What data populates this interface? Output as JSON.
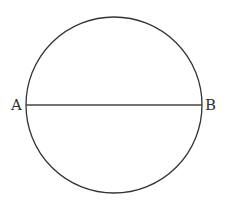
{
  "diagram": {
    "type": "circle-with-diameter",
    "circle": {
      "cx": 114,
      "cy": 105,
      "r": 88,
      "stroke": "#333333"
    },
    "diameter": {
      "from": "A",
      "to": "B",
      "stroke": "#444444"
    },
    "labels": {
      "A": "A",
      "B": "B"
    }
  }
}
